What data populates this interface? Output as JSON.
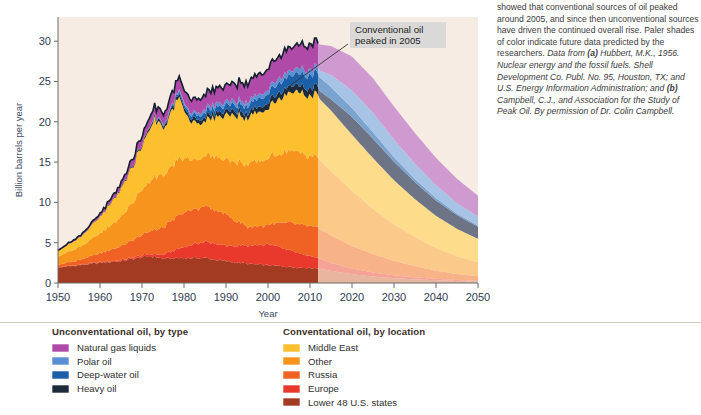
{
  "chart_data": {
    "type": "area",
    "stacked": true,
    "title": "",
    "xlabel": "Year",
    "ylabel": "Billion barrels per year",
    "xlim": [
      1950,
      2050
    ],
    "ylim": [
      0,
      33
    ],
    "xticks": [
      1950,
      1960,
      1970,
      1980,
      1990,
      2000,
      2010,
      2020,
      2030,
      2040,
      2050
    ],
    "yticks": [
      0,
      5,
      10,
      15,
      20,
      25,
      30
    ],
    "grid": false,
    "legend_position": "below-plot",
    "forecast_start_year": 2012,
    "plot_background": "#f7ece4",
    "annotations": [
      {
        "text_line1": "Conventional oil",
        "text_line2": "peaked in 2005",
        "points_to_year": 2005,
        "points_to_value": 24.4
      }
    ],
    "x": [
      1950,
      1955,
      1960,
      1965,
      1970,
      1973,
      1975,
      1979,
      1981,
      1983,
      1985,
      1990,
      1995,
      2000,
      2005,
      2008,
      2010,
      2012,
      2015,
      2020,
      2025,
      2030,
      2035,
      2040,
      2045,
      2050
    ],
    "series": [
      {
        "name": "Lower 48 U.S. states",
        "group": "conventional",
        "color": "#a33a22",
        "pale": "#e8b59e",
        "values": [
          1.9,
          2.2,
          2.5,
          2.7,
          3.2,
          3.3,
          3.0,
          3.1,
          3.1,
          3.1,
          3.1,
          2.7,
          2.4,
          2.2,
          2.0,
          1.9,
          1.9,
          1.8,
          1.5,
          1.1,
          0.8,
          0.6,
          0.45,
          0.35,
          0.25,
          0.2
        ]
      },
      {
        "name": "Europe",
        "group": "conventional",
        "color": "#e8392c",
        "pale": "#f5a396",
        "values": [
          0.05,
          0.05,
          0.1,
          0.15,
          0.2,
          0.3,
          0.5,
          1.2,
          1.5,
          1.8,
          2.0,
          1.9,
          2.2,
          2.6,
          2.2,
          1.7,
          1.5,
          1.3,
          1.0,
          0.7,
          0.5,
          0.35,
          0.25,
          0.18,
          0.12,
          0.08
        ]
      },
      {
        "name": "Russia",
        "group": "conventional",
        "color": "#ef6223",
        "pale": "#f8b287",
        "values": [
          0.3,
          0.6,
          1.1,
          1.7,
          2.6,
          3.0,
          3.3,
          4.2,
          4.3,
          4.3,
          4.4,
          3.9,
          2.3,
          2.4,
          3.4,
          3.6,
          3.7,
          3.7,
          3.4,
          2.8,
          2.3,
          1.8,
          1.4,
          1.0,
          0.75,
          0.55
        ]
      },
      {
        "name": "Other",
        "group": "conventional",
        "color": "#f7941e",
        "pale": "#fbc98a",
        "values": [
          1.0,
          1.6,
          2.4,
          3.6,
          5.6,
          6.7,
          6.3,
          7.0,
          6.4,
          6.2,
          6.3,
          6.9,
          7.7,
          8.3,
          8.9,
          8.8,
          8.7,
          8.6,
          8.0,
          6.8,
          5.6,
          4.5,
          3.6,
          2.8,
          2.2,
          1.75
        ]
      },
      {
        "name": "Middle East",
        "group": "conventional",
        "color": "#fcbf2e",
        "pale": "#fddc8c",
        "values": [
          0.7,
          1.1,
          2.0,
          3.4,
          5.4,
          7.2,
          6.0,
          7.4,
          5.0,
          4.4,
          4.3,
          5.6,
          5.8,
          6.3,
          7.3,
          7.5,
          7.6,
          7.6,
          7.5,
          7.0,
          6.3,
          5.5,
          4.7,
          4.0,
          3.4,
          2.9
        ]
      },
      {
        "name": "Heavy oil",
        "group": "unconventional",
        "color": "#1d2a3c",
        "pale": "#6c7486",
        "values": [
          0.0,
          0.0,
          0.05,
          0.1,
          0.2,
          0.3,
          0.3,
          0.4,
          0.4,
          0.45,
          0.5,
          0.55,
          0.6,
          0.7,
          0.8,
          0.85,
          0.9,
          0.95,
          1.4,
          2.2,
          2.4,
          2.3,
          2.1,
          1.9,
          1.7,
          1.5
        ]
      },
      {
        "name": "Deep-water oil",
        "group": "unconventional",
        "color": "#1a5fa8",
        "pale": "#7ba3cf",
        "values": [
          0.0,
          0.0,
          0.0,
          0.0,
          0.05,
          0.1,
          0.15,
          0.3,
          0.4,
          0.5,
          0.6,
          0.7,
          0.9,
          1.1,
          1.3,
          1.5,
          1.6,
          1.7,
          1.5,
          1.1,
          0.8,
          0.55,
          0.4,
          0.3,
          0.2,
          0.15
        ]
      },
      {
        "name": "Polar oil",
        "group": "unconventional",
        "color": "#5b8fd4",
        "pale": "#a7c3e6",
        "values": [
          0.0,
          0.0,
          0.0,
          0.0,
          0.0,
          0.05,
          0.1,
          0.2,
          0.3,
          0.35,
          0.4,
          0.45,
          0.5,
          0.55,
          0.6,
          0.65,
          0.7,
          0.75,
          1.5,
          2.2,
          2.4,
          2.2,
          1.9,
          1.6,
          1.3,
          1.1
        ]
      },
      {
        "name": "Natural gas liquids",
        "group": "unconventional",
        "color": "#b04aa8",
        "pale": "#cf9ad0",
        "values": [
          0.1,
          0.2,
          0.35,
          0.6,
          1.0,
          1.2,
          1.2,
          1.6,
          1.6,
          1.7,
          1.8,
          2.0,
          2.3,
          2.6,
          2.9,
          3.0,
          3.1,
          3.2,
          3.6,
          4.2,
          4.3,
          4.1,
          3.8,
          3.4,
          3.0,
          2.6
        ]
      }
    ]
  },
  "annotation": {
    "line1": "Conventional oil",
    "line2": "peaked in 2005"
  },
  "axes": {
    "ylabel": "Billion barrels per year",
    "xlabel": "Year",
    "yticks": [
      "0",
      "5",
      "10",
      "15",
      "20",
      "25",
      "30"
    ],
    "xticks": [
      "1950",
      "1960",
      "1970",
      "1980",
      "1990",
      "2000",
      "2010",
      "2020",
      "2030",
      "2040",
      "2050"
    ]
  },
  "legend": {
    "left": {
      "heading": "Unconventational oil, by type",
      "items": [
        {
          "label": "Natural gas liquids",
          "color": "#b04aa8"
        },
        {
          "label": "Polar oil",
          "color": "#5b8fd4"
        },
        {
          "label": "Deep-water oil",
          "color": "#1a5fa8"
        },
        {
          "label": "Heavy oil",
          "color": "#1d2a3c"
        }
      ]
    },
    "right": {
      "heading": "Conventational oil, by location",
      "items": [
        {
          "label": "Middle East",
          "color": "#fcbf2e"
        },
        {
          "label": "Other",
          "color": "#f7941e"
        },
        {
          "label": "Russia",
          "color": "#ef6223"
        },
        {
          "label": "Europe",
          "color": "#e8392c"
        },
        {
          "label": "Lower 48 U.S. states",
          "color": "#a33a22"
        }
      ]
    }
  },
  "caption": {
    "body": "showed that conventional sources of oil peaked around 2005, and since then unconventional sources have driven the continued overall rise. Paler shades of color indicate future data predicted by the researchers. ",
    "source_italic_1": "Data from ",
    "source_bold_1": "(a)",
    "source_italic_2": " Hubbert, M.K., 1956. Nuclear energy and the fossil fuels. Shell Development Co. Publ. No. 95, Houston, TX; and U.S. Energy Information Administration; and ",
    "source_bold_2": "(b)",
    "source_italic_3": " Campbell, C.J., and Association for the Study of Peak Oil. By permission of Dr. Colin Campbell."
  }
}
